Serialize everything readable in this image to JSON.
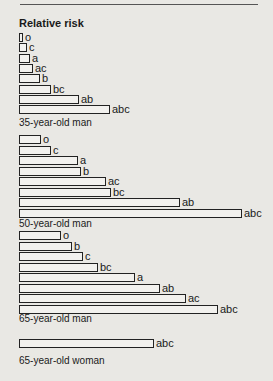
{
  "chart_data": {
    "type": "bar",
    "orientation": "horizontal",
    "title": "Relative risk",
    "xlabel": "",
    "ylabel": "",
    "grid": false,
    "groups": [
      {
        "name": "35-year-old man",
        "categories": [
          "o",
          "c",
          "a",
          "ac",
          "b",
          "bc",
          "ab",
          "abc"
        ],
        "values": [
          4,
          8,
          11,
          14,
          21,
          32,
          60,
          91
        ]
      },
      {
        "name": "50-year-old man",
        "categories": [
          "o",
          "c",
          "a",
          "b",
          "ac",
          "bc",
          "ab",
          "abc"
        ],
        "values": [
          22,
          32,
          59,
          62,
          87,
          92,
          161,
          223
        ]
      },
      {
        "name": "65-year-old man",
        "categories": [
          "o",
          "b",
          "c",
          "bc",
          "a",
          "ab",
          "ac",
          "abc"
        ],
        "values": [
          42,
          53,
          64,
          79,
          116,
          141,
          167,
          199
        ]
      },
      {
        "name": "65-year-old woman",
        "categories": [
          "abc"
        ],
        "values": [
          135
        ]
      }
    ]
  },
  "layout": {
    "x0": 19,
    "groups": [
      {
        "top": 33,
        "step": 10.3,
        "caption_top": 117
      },
      {
        "top": 135,
        "step": 10.5,
        "caption_top": 218
      },
      {
        "top": 231,
        "step": 10.5,
        "caption_top": 313
      },
      {
        "top": 339,
        "step": 10.5,
        "caption_top": 355
      }
    ]
  }
}
